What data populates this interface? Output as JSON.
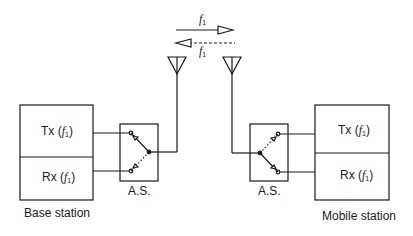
{
  "frequency_labels": {
    "forward": "f",
    "forward_sub": "1",
    "reverse": "f",
    "reverse_sub": "1"
  },
  "base_station": {
    "label": "Base station",
    "tx": {
      "prefix": "Tx (",
      "freq": "f",
      "sub": "1",
      "suffix": ")"
    },
    "rx": {
      "prefix": "Rx (",
      "freq": "f",
      "sub": "1",
      "suffix": ")"
    },
    "switch_label": "A.S."
  },
  "mobile_station": {
    "label": "Mobile station",
    "tx": {
      "prefix": "Tx (",
      "freq": "f",
      "sub": "1",
      "suffix": ")"
    },
    "rx": {
      "prefix": "Rx (",
      "freq": "f",
      "sub": "1",
      "suffix": ")"
    },
    "switch_label": "A.S."
  },
  "colors": {
    "stroke": "#1a1a1a",
    "background": "#ffffff"
  }
}
